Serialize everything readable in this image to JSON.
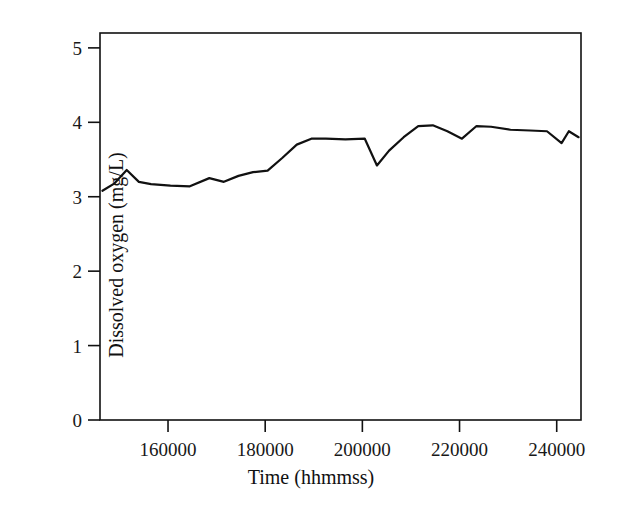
{
  "chart_data": {
    "type": "line",
    "title": "",
    "subtitle": "",
    "xlabel": "Time (hhmmss)",
    "ylabel": "Dissolved oxygen (mg/L)",
    "xlim": [
      146000,
      245000
    ],
    "ylim": [
      0,
      5.2
    ],
    "grid": false,
    "legend": null,
    "legend_position": "none",
    "xticks": [
      160000,
      180000,
      200000,
      220000,
      240000
    ],
    "xtick_labels": [
      "160000",
      "180000",
      "200000",
      "220000",
      "240000"
    ],
    "yticks": [
      0,
      1,
      2,
      3,
      4,
      5
    ],
    "ytick_labels": [
      "0",
      "1",
      "2",
      "3",
      "4",
      "5"
    ],
    "series": [
      {
        "name": "Dissolved oxygen",
        "color": "#111111",
        "line_width": 2.2,
        "x": [
          146500,
          149000,
          151500,
          154000,
          156500,
          160500,
          164500,
          168500,
          171500,
          174500,
          177500,
          180500,
          183500,
          186500,
          189500,
          192500,
          196500,
          200500,
          203000,
          205500,
          208500,
          211500,
          214500,
          217500,
          220500,
          223500,
          226500,
          230500,
          234500,
          238000,
          241000,
          242500,
          244500
        ],
        "y": [
          3.08,
          3.18,
          3.36,
          3.2,
          3.17,
          3.15,
          3.14,
          3.25,
          3.2,
          3.28,
          3.33,
          3.35,
          3.52,
          3.7,
          3.78,
          3.78,
          3.77,
          3.78,
          3.42,
          3.62,
          3.8,
          3.95,
          3.96,
          3.88,
          3.78,
          3.95,
          3.94,
          3.9,
          3.89,
          3.88,
          3.72,
          3.88,
          3.8
        ]
      }
    ]
  },
  "axes": {
    "frame_color": "#111111",
    "background": "#ffffff"
  }
}
